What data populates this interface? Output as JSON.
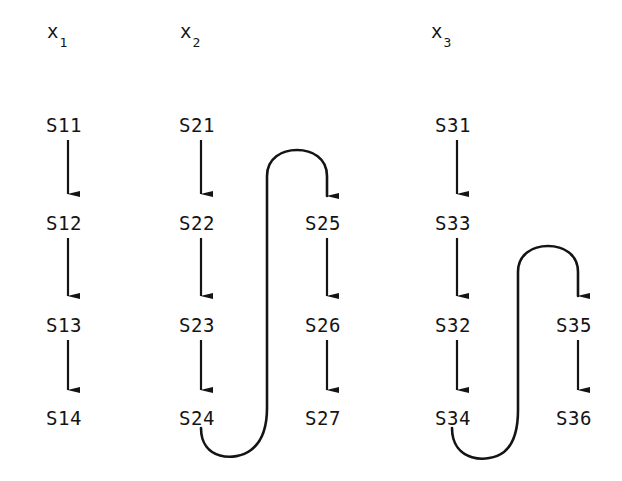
{
  "figure": {
    "background_color": "#ffffff",
    "ink_color": "#141414",
    "width": 622,
    "height": 481
  },
  "columns": [
    {
      "id": "x1",
      "header_base": "x",
      "header_sub": "1",
      "header_x": 47,
      "header_y": 22
    },
    {
      "id": "x2",
      "header_base": "x",
      "header_sub": "2",
      "header_x": 180,
      "header_y": 22
    },
    {
      "id": "x3",
      "header_base": "x",
      "header_sub": "3",
      "header_x": 431,
      "header_y": 22
    }
  ],
  "nodes": [
    {
      "id": "s11",
      "label": "S11",
      "x": 46,
      "y": 116,
      "column": "x1"
    },
    {
      "id": "s12",
      "label": "S12",
      "x": 46,
      "y": 214,
      "column": "x1"
    },
    {
      "id": "s13",
      "label": "S13",
      "x": 46,
      "y": 316,
      "column": "x1"
    },
    {
      "id": "s14",
      "label": "S14",
      "x": 46,
      "y": 409,
      "column": "x1"
    },
    {
      "id": "s21",
      "label": "S21",
      "x": 179,
      "y": 116,
      "column": "x2"
    },
    {
      "id": "s22",
      "label": "S22",
      "x": 179,
      "y": 214,
      "column": "x2"
    },
    {
      "id": "s23",
      "label": "S23",
      "x": 179,
      "y": 316,
      "column": "x2"
    },
    {
      "id": "s24",
      "label": "S24",
      "x": 179,
      "y": 409,
      "column": "x2"
    },
    {
      "id": "s25",
      "label": "S25",
      "x": 305,
      "y": 214,
      "column": "x2"
    },
    {
      "id": "s26",
      "label": "S26",
      "x": 305,
      "y": 316,
      "column": "x2"
    },
    {
      "id": "s27",
      "label": "S27",
      "x": 305,
      "y": 409,
      "column": "x2"
    },
    {
      "id": "s31",
      "label": "S31",
      "x": 435,
      "y": 116,
      "column": "x3"
    },
    {
      "id": "s33",
      "label": "S33",
      "x": 435,
      "y": 214,
      "column": "x3"
    },
    {
      "id": "s32",
      "label": "S32",
      "x": 435,
      "y": 316,
      "column": "x3"
    },
    {
      "id": "s34",
      "label": "S34",
      "x": 435,
      "y": 409,
      "column": "x3"
    },
    {
      "id": "s35",
      "label": "S35",
      "x": 556,
      "y": 316,
      "column": "x3"
    },
    {
      "id": "s36",
      "label": "S36",
      "x": 556,
      "y": 409,
      "column": "x3"
    }
  ],
  "edges": [
    {
      "id": "e-s11-s12",
      "from": "S11",
      "to": "S12",
      "shape": "straight-down"
    },
    {
      "id": "e-s12-s13",
      "from": "S12",
      "to": "S13",
      "shape": "straight-down"
    },
    {
      "id": "e-s13-s14",
      "from": "S13",
      "to": "S14",
      "shape": "straight-down"
    },
    {
      "id": "e-s21-s22",
      "from": "S21",
      "to": "S22",
      "shape": "straight-down"
    },
    {
      "id": "e-s22-s23",
      "from": "S22",
      "to": "S23",
      "shape": "straight-down"
    },
    {
      "id": "e-s23-s24",
      "from": "S23",
      "to": "S24",
      "shape": "straight-down"
    },
    {
      "id": "e-s24-s25",
      "from": "S24",
      "to": "S25",
      "shape": "u-turn-up-right"
    },
    {
      "id": "e-s25-s26",
      "from": "S25",
      "to": "S26",
      "shape": "straight-down"
    },
    {
      "id": "e-s26-s27",
      "from": "S26",
      "to": "S27",
      "shape": "straight-down"
    },
    {
      "id": "e-s31-s33",
      "from": "S31",
      "to": "S33",
      "shape": "straight-down"
    },
    {
      "id": "e-s33-s32",
      "from": "S33",
      "to": "S32",
      "shape": "straight-down"
    },
    {
      "id": "e-s32-s34",
      "from": "S32",
      "to": "S34",
      "shape": "straight-down"
    },
    {
      "id": "e-s34-s35",
      "from": "S34",
      "to": "S35",
      "shape": "u-turn-up-right"
    },
    {
      "id": "e-s35-s36",
      "from": "S35",
      "to": "S36",
      "shape": "straight-down"
    }
  ]
}
